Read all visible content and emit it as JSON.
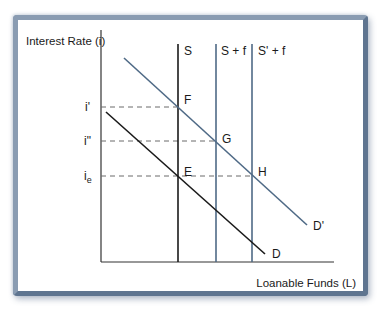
{
  "diagram": {
    "y_axis_label": "Interest Rate (i)",
    "x_axis_label": "Loanable Funds (L)",
    "rate_labels": {
      "i_prime": "i'",
      "i_double_prime": "i\"",
      "i_e_base": "i",
      "i_e_sub": "e"
    },
    "curves": {
      "S": "S",
      "S_plus_f": "S + f",
      "S_prime_plus_f": "S' + f",
      "D": "D",
      "D_prime": "D'"
    },
    "points": {
      "E": "E",
      "F": "F",
      "G": "G",
      "H": "H"
    },
    "colors": {
      "black_line": "#1a1a1a",
      "blue_line": "#4f6a86",
      "axis": "#333333",
      "dash": "#6a6a6a",
      "frame": "#7a8ea8"
    }
  }
}
